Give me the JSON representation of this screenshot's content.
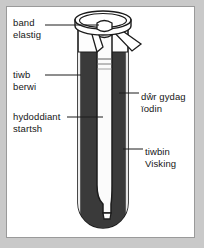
{
  "figure": {
    "title_alt": "Diagram of boiling tube with Visking tubing in iodine water",
    "labels": {
      "band_elastig": {
        "line1": "band",
        "line2": "elastig"
      },
      "tiwb_berwi": {
        "line1": "tiwb",
        "line2": "berwi"
      },
      "hydoddiant_startsh": {
        "line1": "hydoddiant",
        "line2": "startsh"
      },
      "dwr_gydag_iodin": {
        "line1": "dŵr gydag",
        "line2": "ïodin"
      },
      "tiwbin_visking": {
        "line1": "tiwbin",
        "line2": "Visking"
      }
    },
    "colors": {
      "iodine_water": "#3a3a3a",
      "starch_solution": "#fbfbfb",
      "outline": "#1c1c1c",
      "glass_highlight": "#d9d9d9",
      "panel_background": "#ffffff",
      "page_background": "#c9c9c9",
      "panel_border": "#9a9a9a",
      "text": "#161616"
    },
    "parts": [
      "rim-ellipse",
      "boiling-tube",
      "iodine-water-fill",
      "visking-tubing",
      "starch-solution-fill",
      "elastic-band",
      "band-flap-left",
      "band-flap-right",
      "visking-knot"
    ]
  }
}
